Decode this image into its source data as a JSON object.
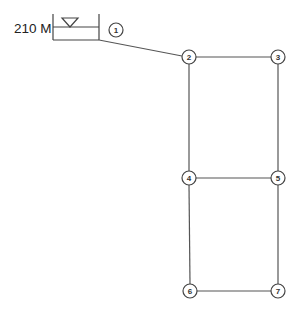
{
  "diagram": {
    "type": "pipe-network",
    "reservoir": {
      "head_label": "210 M",
      "node_id": "1",
      "water_level_symbol": "inverted-triangle"
    },
    "nodes": [
      {
        "id": "1",
        "label": "1",
        "x": 116,
        "y": 30
      },
      {
        "id": "2",
        "label": "2",
        "x": 189,
        "y": 57
      },
      {
        "id": "3",
        "label": "3",
        "x": 278,
        "y": 57
      },
      {
        "id": "4",
        "label": "4",
        "x": 189,
        "y": 178
      },
      {
        "id": "5",
        "label": "5",
        "x": 278,
        "y": 178
      },
      {
        "id": "6",
        "label": "6",
        "x": 190,
        "y": 291
      },
      {
        "id": "7",
        "label": "7",
        "x": 278,
        "y": 291
      }
    ],
    "pipes": [
      {
        "from": "1",
        "to": "2"
      },
      {
        "from": "2",
        "to": "3"
      },
      {
        "from": "2",
        "to": "4"
      },
      {
        "from": "3",
        "to": "5"
      },
      {
        "from": "4",
        "to": "5"
      },
      {
        "from": "4",
        "to": "6"
      },
      {
        "from": "5",
        "to": "7"
      },
      {
        "from": "6",
        "to": "7"
      }
    ],
    "colors": {
      "line": "#555555",
      "text": "#222222",
      "background": "#ffffff"
    }
  }
}
